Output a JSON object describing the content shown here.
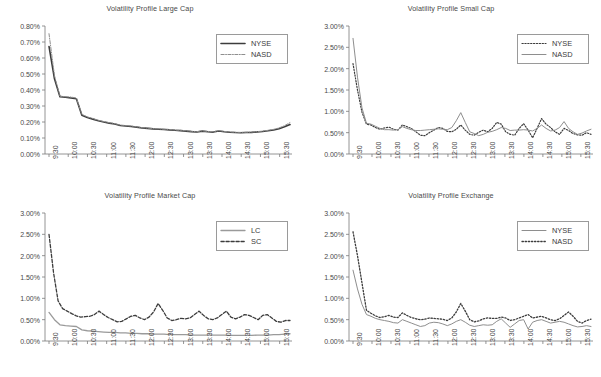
{
  "figure": {
    "background": "#ffffff",
    "axis_color": "#7a7a7a",
    "text_color": "#4a4a4a",
    "series_colors": {
      "dark": "#3c3c3c",
      "light": "#8e8e8e"
    }
  },
  "chart_data": [
    {
      "id": "large-cap",
      "type": "line",
      "title": "Volatility Profile Large Cap",
      "xlabel": "",
      "ylabel": "",
      "ylim": [
        0,
        0.008
      ],
      "ytick_values": [
        0,
        0.001,
        0.002,
        0.003,
        0.004,
        0.005,
        0.006,
        0.007,
        0.008
      ],
      "ytick_labels": [
        "0.00%",
        "0.10%",
        "0.20%",
        "0.30%",
        "0.40%",
        "0.50%",
        "0.60%",
        "0.70%",
        "0.80%"
      ],
      "xtick_labels": [
        "9:30",
        "10:00",
        "10:30",
        "11:00",
        "11:30",
        "12:00",
        "12:30",
        "13:00",
        "13:30",
        "14:00",
        "14:30",
        "15:00",
        "15:30"
      ],
      "grid": false,
      "legend_position": "top-right",
      "series": [
        {
          "name": "NYSE",
          "style": "solid",
          "width": 1.6,
          "color": "#3c3c3c",
          "values": [
            0.00672,
            0.0047,
            0.00358,
            0.00355,
            0.0035,
            0.00345,
            0.00242,
            0.00228,
            0.00218,
            0.00208,
            0.002,
            0.00193,
            0.00188,
            0.00178,
            0.00175,
            0.00172,
            0.00168,
            0.00163,
            0.0016,
            0.00157,
            0.00155,
            0.00153,
            0.00151,
            0.00148,
            0.00146,
            0.00143,
            0.0014,
            0.00138,
            0.00143,
            0.00139,
            0.00137,
            0.00144,
            0.00139,
            0.00136,
            0.00134,
            0.00133,
            0.00134,
            0.00135,
            0.00138,
            0.00141,
            0.00145,
            0.0015,
            0.00158,
            0.0017,
            0.00184
          ]
        },
        {
          "name": "NASD",
          "style": "dashdot",
          "width": 1.0,
          "color": "#8e8e8e",
          "values": [
            0.00752,
            0.0049,
            0.00362,
            0.00358,
            0.00356,
            0.0035,
            0.00248,
            0.00232,
            0.00222,
            0.00211,
            0.00203,
            0.00196,
            0.0019,
            0.00181,
            0.00178,
            0.00175,
            0.0017,
            0.00165,
            0.00162,
            0.00159,
            0.00157,
            0.00155,
            0.00153,
            0.0015,
            0.00148,
            0.00145,
            0.00142,
            0.0014,
            0.00145,
            0.00141,
            0.00139,
            0.00146,
            0.00141,
            0.00138,
            0.00136,
            0.00135,
            0.00136,
            0.00137,
            0.0014,
            0.00143,
            0.00148,
            0.00154,
            0.00163,
            0.00177,
            0.00196
          ]
        }
      ]
    },
    {
      "id": "small-cap",
      "type": "line",
      "title": "Volatility Profile Small Cap",
      "xlabel": "",
      "ylabel": "",
      "ylim": [
        0,
        0.03
      ],
      "ytick_values": [
        0,
        0.005,
        0.01,
        0.015,
        0.02,
        0.025,
        0.03
      ],
      "ytick_labels": [
        "0.00%",
        "0.50%",
        "1.00%",
        "1.50%",
        "2.00%",
        "2.50%",
        "3.00%"
      ],
      "xtick_labels": [
        "9:30",
        "10:00",
        "10:30",
        "11:00",
        "11:30",
        "12:00",
        "12:30",
        "13:00",
        "13:30",
        "14:00",
        "14:30",
        "15:00",
        "15:30"
      ],
      "grid": false,
      "legend_position": "top-right",
      "series": [
        {
          "name": "NYSE",
          "style": "dotted",
          "width": 1.2,
          "color": "#3c3c3c",
          "values": [
            0.0212,
            0.015,
            0.0098,
            0.007,
            0.0068,
            0.0062,
            0.0058,
            0.0061,
            0.0063,
            0.0058,
            0.0056,
            0.0068,
            0.0064,
            0.006,
            0.0052,
            0.0044,
            0.0043,
            0.005,
            0.0056,
            0.0062,
            0.006,
            0.0053,
            0.0052,
            0.0058,
            0.0068,
            0.0056,
            0.0046,
            0.0044,
            0.0051,
            0.0056,
            0.0052,
            0.006,
            0.0074,
            0.007,
            0.0052,
            0.0046,
            0.0044,
            0.006,
            0.0071,
            0.0056,
            0.0038,
            0.006,
            0.0083,
            0.007,
            0.0062,
            0.0052,
            0.0046,
            0.006,
            0.0055,
            0.0048,
            0.0045,
            0.0044,
            0.005,
            0.0046
          ]
        },
        {
          "name": "NASD",
          "style": "solid",
          "width": 1.0,
          "color": "#8e8e8e",
          "values": [
            0.0271,
            0.018,
            0.0108,
            0.0072,
            0.007,
            0.0065,
            0.006,
            0.0057,
            0.0057,
            0.0056,
            0.0057,
            0.0064,
            0.006,
            0.0057,
            0.0055,
            0.0055,
            0.0056,
            0.0057,
            0.0058,
            0.0059,
            0.0058,
            0.0057,
            0.0062,
            0.0078,
            0.0097,
            0.0074,
            0.0052,
            0.0048,
            0.0043,
            0.0046,
            0.0051,
            0.0053,
            0.0057,
            0.0062,
            0.006,
            0.0055,
            0.0056,
            0.0056,
            0.0057,
            0.0056,
            0.0054,
            0.006,
            0.0068,
            0.006,
            0.0054,
            0.0056,
            0.0062,
            0.0076,
            0.006,
            0.0052,
            0.0046,
            0.0049,
            0.0054,
            0.0058
          ]
        }
      ]
    },
    {
      "id": "market-cap",
      "type": "line",
      "title": "Volatility Profile Market Cap",
      "xlabel": "",
      "ylabel": "",
      "ylim": [
        0,
        0.03
      ],
      "ytick_values": [
        0,
        0.005,
        0.01,
        0.015,
        0.02,
        0.025,
        0.03
      ],
      "ytick_labels": [
        "0.00%",
        "0.50%",
        "1.00%",
        "1.50%",
        "2.00%",
        "2.50%",
        "3.00%"
      ],
      "xtick_labels": [
        "9:30",
        "10:00",
        "10:30",
        "11:00",
        "11:30",
        "12:00",
        "12:30",
        "13:00",
        "13:30",
        "14:00",
        "14:30",
        "15:00",
        "15:30"
      ],
      "grid": false,
      "legend_position": "top-right",
      "series": [
        {
          "name": "LC",
          "style": "solid",
          "width": 1.3,
          "color": "#9a9a9a",
          "values": [
            0.0067,
            0.005,
            0.0038,
            0.0036,
            0.0035,
            0.0034,
            0.0026,
            0.0024,
            0.0023,
            0.0022,
            0.0021,
            0.002,
            0.002,
            0.0019,
            0.0019,
            0.0018,
            0.0018,
            0.0017,
            0.0017,
            0.0016,
            0.0016,
            0.0016,
            0.0015,
            0.0015,
            0.0015,
            0.0015,
            0.0014,
            0.0014,
            0.0014,
            0.0014,
            0.0014,
            0.0014,
            0.0014,
            0.0013,
            0.0013,
            0.0013,
            0.0013,
            0.0013,
            0.0014,
            0.0014,
            0.0014,
            0.0015,
            0.0015,
            0.0016,
            0.0017
          ]
        },
        {
          "name": "SC",
          "style": "dashed",
          "width": 1.3,
          "color": "#3c3c3c",
          "values": [
            0.025,
            0.016,
            0.0094,
            0.0076,
            0.007,
            0.0064,
            0.0059,
            0.0056,
            0.0057,
            0.0058,
            0.0062,
            0.007,
            0.0062,
            0.0055,
            0.005,
            0.0045,
            0.0046,
            0.0052,
            0.0058,
            0.006,
            0.0054,
            0.005,
            0.0056,
            0.0068,
            0.0088,
            0.0072,
            0.0054,
            0.0048,
            0.005,
            0.0053,
            0.0052,
            0.0054,
            0.0062,
            0.007,
            0.006,
            0.0052,
            0.005,
            0.0054,
            0.0062,
            0.007,
            0.0056,
            0.0052,
            0.0056,
            0.0062,
            0.006,
            0.0055,
            0.005,
            0.006,
            0.0062,
            0.0054,
            0.0046,
            0.0044,
            0.0048,
            0.0048
          ]
        }
      ]
    },
    {
      "id": "exchange",
      "type": "line",
      "title": "Volatility Profile Exchange",
      "xlabel": "",
      "ylabel": "",
      "ylim": [
        0,
        0.03
      ],
      "ytick_values": [
        0,
        0.005,
        0.01,
        0.015,
        0.02,
        0.025,
        0.03
      ],
      "ytick_labels": [
        "0.00%",
        "0.50%",
        "1.00%",
        "1.50%",
        "2.00%",
        "2.50%",
        "3.00%"
      ],
      "xtick_labels": [
        "9:30",
        "10:00",
        "10:30",
        "11:00",
        "11:30",
        "12:00",
        "12:30",
        "13:00",
        "13:30",
        "14:00",
        "14:30",
        "15:00",
        "15:30"
      ],
      "grid": false,
      "legend_position": "top-right",
      "series": [
        {
          "name": "NYSE",
          "style": "solid",
          "width": 1.0,
          "color": "#8e8e8e",
          "values": [
            0.0166,
            0.0122,
            0.0086,
            0.0062,
            0.0058,
            0.0053,
            0.005,
            0.0048,
            0.0046,
            0.0043,
            0.0042,
            0.005,
            0.0046,
            0.0042,
            0.0038,
            0.0034,
            0.0036,
            0.0042,
            0.0044,
            0.0043,
            0.004,
            0.0036,
            0.004,
            0.0046,
            0.005,
            0.0044,
            0.0037,
            0.0034,
            0.0036,
            0.0038,
            0.0037,
            0.0038,
            0.0046,
            0.0052,
            0.0042,
            0.0032,
            0.004,
            0.0048,
            0.005,
            0.0028,
            0.0044,
            0.0048,
            0.005,
            0.0046,
            0.0042,
            0.0044,
            0.0046,
            0.0044,
            0.004,
            0.0036,
            0.0033,
            0.0034,
            0.0036,
            0.0034
          ]
        },
        {
          "name": "NASD",
          "style": "dotted",
          "width": 1.3,
          "color": "#3c3c3c",
          "values": [
            0.0256,
            0.02,
            0.0136,
            0.0072,
            0.0065,
            0.0059,
            0.0055,
            0.0057,
            0.006,
            0.0056,
            0.0055,
            0.0066,
            0.006,
            0.0055,
            0.0052,
            0.005,
            0.0051,
            0.0054,
            0.0053,
            0.0052,
            0.0051,
            0.0048,
            0.0054,
            0.0068,
            0.0088,
            0.007,
            0.005,
            0.0045,
            0.0047,
            0.0052,
            0.0054,
            0.0053,
            0.0053,
            0.0056,
            0.0054,
            0.0048,
            0.005,
            0.0054,
            0.0058,
            0.0062,
            0.0054,
            0.0056,
            0.0058,
            0.0054,
            0.005,
            0.0048,
            0.0052,
            0.006,
            0.0068,
            0.0058,
            0.0046,
            0.0042,
            0.0048,
            0.0051
          ]
        }
      ]
    }
  ]
}
